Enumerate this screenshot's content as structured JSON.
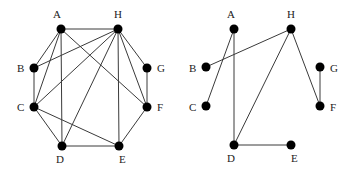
{
  "graphs": [
    {
      "name": "left-graph",
      "nodes": [
        {
          "id": "A",
          "x": 61,
          "y": 29,
          "lx": 53,
          "ly": 18
        },
        {
          "id": "H",
          "x": 118,
          "y": 29,
          "lx": 114,
          "ly": 18
        },
        {
          "id": "B",
          "x": 34,
          "y": 68,
          "lx": 17,
          "ly": 72
        },
        {
          "id": "G",
          "x": 147,
          "y": 68,
          "lx": 157,
          "ly": 72
        },
        {
          "id": "C",
          "x": 34,
          "y": 107,
          "lx": 17,
          "ly": 111
        },
        {
          "id": "F",
          "x": 147,
          "y": 107,
          "lx": 157,
          "ly": 111
        },
        {
          "id": "D",
          "x": 62,
          "y": 146,
          "lx": 56,
          "ly": 163
        },
        {
          "id": "E",
          "x": 119,
          "y": 146,
          "lx": 119,
          "ly": 163
        }
      ],
      "edges": [
        [
          "A",
          "H"
        ],
        [
          "A",
          "B"
        ],
        [
          "A",
          "C"
        ],
        [
          "A",
          "D"
        ],
        [
          "A",
          "F"
        ],
        [
          "H",
          "B"
        ],
        [
          "H",
          "C"
        ],
        [
          "H",
          "D"
        ],
        [
          "H",
          "E"
        ],
        [
          "H",
          "F"
        ],
        [
          "H",
          "G"
        ],
        [
          "B",
          "C"
        ],
        [
          "G",
          "F"
        ],
        [
          "C",
          "D"
        ],
        [
          "C",
          "E"
        ],
        [
          "D",
          "E"
        ],
        [
          "E",
          "F"
        ]
      ]
    },
    {
      "name": "right-graph",
      "nodes": [
        {
          "id": "A",
          "x": 234,
          "y": 29,
          "lx": 227,
          "ly": 18
        },
        {
          "id": "H",
          "x": 291,
          "y": 29,
          "lx": 287,
          "ly": 18
        },
        {
          "id": "B",
          "x": 206,
          "y": 67,
          "lx": 189,
          "ly": 72
        },
        {
          "id": "G",
          "x": 320,
          "y": 67,
          "lx": 330,
          "ly": 72
        },
        {
          "id": "C",
          "x": 206,
          "y": 106,
          "lx": 189,
          "ly": 111
        },
        {
          "id": "F",
          "x": 320,
          "y": 106,
          "lx": 330,
          "ly": 111
        },
        {
          "id": "D",
          "x": 234,
          "y": 145,
          "lx": 227,
          "ly": 162
        },
        {
          "id": "E",
          "x": 291,
          "y": 145,
          "lx": 291,
          "ly": 162
        }
      ],
      "edges": [
        [
          "A",
          "C"
        ],
        [
          "A",
          "D"
        ],
        [
          "H",
          "B"
        ],
        [
          "H",
          "D"
        ],
        [
          "H",
          "F"
        ],
        [
          "G",
          "F"
        ],
        [
          "D",
          "E"
        ]
      ]
    }
  ]
}
